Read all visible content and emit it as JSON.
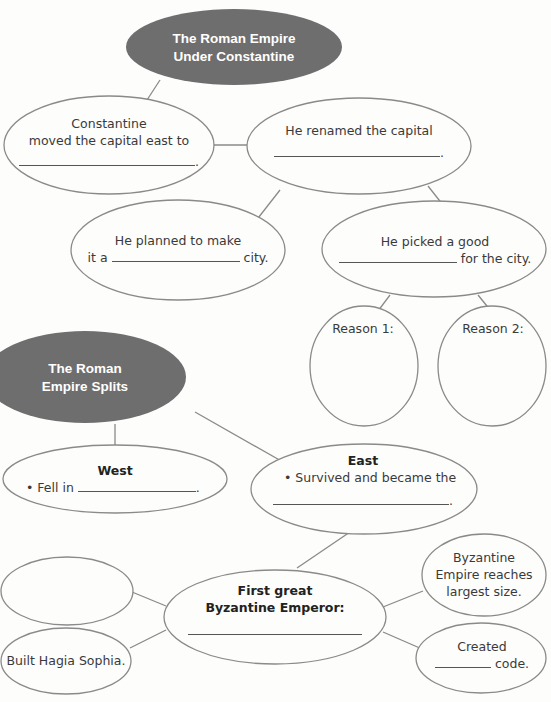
{
  "colors": {
    "title_fill": "#6e6e6e",
    "title_text": "#ffffff",
    "stroke": "#8a8a8a",
    "text": "#3a3a3a",
    "background": "#fdfdfb"
  },
  "section1": {
    "title_line1": "The Roman Empire",
    "title_line2": "Under Constantine",
    "capital_moved": {
      "line1": "Constantine",
      "line2": "moved the capital east to",
      "end": "."
    },
    "renamed": {
      "line1": "He renamed the capital",
      "end": "."
    },
    "planned": {
      "line1": "He planned to make",
      "prefix": "it a",
      "suffix": "city."
    },
    "picked": {
      "line1": "He picked a good",
      "suffix": "for the city."
    },
    "reason1": "Reason 1:",
    "reason2": "Reason 2:"
  },
  "section2": {
    "title_line1": "The Roman",
    "title_line2": "Empire Splits",
    "west": {
      "heading": "West",
      "bullet": "•",
      "prefix": "Fell in",
      "end": "."
    },
    "east": {
      "heading": "East",
      "bullet": "•",
      "line1": "Survived and became the",
      "end": "."
    },
    "emperor": {
      "line1": "First great",
      "line2": "Byzantine Emperor:"
    },
    "largest": {
      "line1": "Byzantine",
      "line2": "Empire reaches",
      "line3": "largest size."
    },
    "code": {
      "line1": "Created",
      "suffix": "code."
    },
    "hagia": "Built Hagia Sophia.",
    "blank_node": ""
  }
}
